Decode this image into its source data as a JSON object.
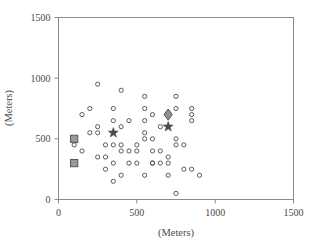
{
  "chart_data": {
    "type": "scatter",
    "title": "",
    "xlabel": "(Meters)",
    "ylabel": "(Meters)",
    "xlim": [
      0,
      1500
    ],
    "ylim": [
      0,
      1500
    ],
    "xticks": [
      0,
      500,
      1000,
      1500
    ],
    "yticks": [
      0,
      500,
      1000,
      1500
    ],
    "xtick_labels": [
      "0",
      "500",
      "1000",
      "1500"
    ],
    "ytick_labels": [
      "0",
      "500",
      "1000",
      "1500"
    ],
    "grid": false,
    "legend": "none",
    "series": [
      {
        "name": "sample-points",
        "marker": "open-circle",
        "color": "#4a4a4a",
        "x": [
          150,
          200,
          250,
          100,
          150,
          250,
          200,
          250,
          250,
          300,
          300,
          300,
          350,
          350,
          350,
          350,
          350,
          400,
          400,
          400,
          400,
          400,
          450,
          450,
          450,
          500,
          500,
          500,
          550,
          550,
          550,
          550,
          550,
          550,
          600,
          600,
          600,
          600,
          600,
          650,
          650,
          650,
          700,
          700,
          700,
          700,
          750,
          750,
          750,
          750,
          750,
          800,
          800,
          850,
          850,
          850,
          850,
          900
        ],
        "y": [
          700,
          750,
          950,
          450,
          400,
          600,
          550,
          550,
          350,
          450,
          350,
          250,
          750,
          650,
          450,
          300,
          150,
          900,
          600,
          450,
          400,
          200,
          650,
          400,
          300,
          450,
          400,
          300,
          850,
          750,
          650,
          550,
          500,
          200,
          700,
          500,
          400,
          300,
          300,
          600,
          400,
          300,
          700,
          350,
          300,
          200,
          850,
          750,
          500,
          450,
          50,
          450,
          250,
          750,
          700,
          650,
          250,
          200
        ]
      },
      {
        "name": "square-markers",
        "marker": "filled-square",
        "color": "#9a9a9a",
        "edge_color": "#555555",
        "x": [
          100,
          100
        ],
        "y": [
          500,
          300
        ]
      },
      {
        "name": "star-markers",
        "marker": "filled-star",
        "color": "#4a4a4a",
        "x": [
          350,
          700
        ],
        "y": [
          550,
          600
        ]
      },
      {
        "name": "diamond-marker",
        "marker": "filled-diamond",
        "color": "#8f8f8f",
        "edge_color": "#555555",
        "x": [
          700
        ],
        "y": [
          700
        ]
      }
    ]
  },
  "figure": {
    "frame_color": "#8a8a8a",
    "background": "#ffffff",
    "text_color": "#4a4a4a"
  }
}
